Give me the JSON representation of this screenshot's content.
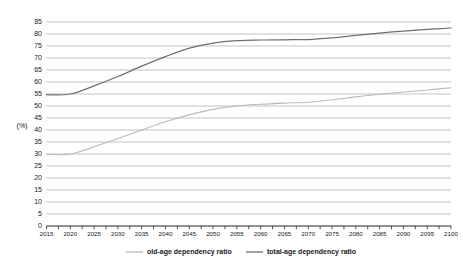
{
  "chart_data": {
    "type": "line",
    "title": "",
    "subtitle": "",
    "xlabel": "",
    "ylabel": "(%)",
    "xlim": [
      2015,
      2100
    ],
    "ylim": [
      0,
      88
    ],
    "grid": true,
    "legend_position": "bottom",
    "ytick_labels": [
      "0",
      "5",
      "10",
      "15",
      "20",
      "25",
      "30",
      "35",
      "40",
      "45",
      "50",
      "55",
      "60",
      "65",
      "70",
      "75",
      "80",
      "85"
    ],
    "ytick_values": [
      0,
      5,
      10,
      15,
      20,
      25,
      30,
      35,
      40,
      45,
      50,
      55,
      60,
      65,
      70,
      75,
      80,
      85
    ],
    "xtick_labels": [
      "2015",
      "2020",
      "2025",
      "2030",
      "2035",
      "2040",
      "2045",
      "2050",
      "2055",
      "2060",
      "2065",
      "2070",
      "2075",
      "2080",
      "2085",
      "2090",
      "2095",
      "2100"
    ],
    "xtick_values": [
      2015,
      2020,
      2025,
      2030,
      2035,
      2040,
      2045,
      2050,
      2055,
      2060,
      2065,
      2070,
      2075,
      2080,
      2085,
      2090,
      2095,
      2100
    ],
    "x": [
      2015,
      2020,
      2025,
      2030,
      2035,
      2040,
      2045,
      2050,
      2055,
      2060,
      2065,
      2070,
      2075,
      2080,
      2085,
      2090,
      2095,
      2100
    ],
    "series": [
      {
        "name": "old-age dependency ratio",
        "color": "#b9b9b9",
        "values": [
          29.8,
          30.0,
          33.0,
          36.5,
          40.0,
          43.4,
          46.3,
          48.6,
          50.0,
          50.7,
          51.2,
          51.6,
          52.6,
          53.8,
          54.9,
          55.8,
          56.7,
          57.6
        ]
      },
      {
        "name": "total-age dependency ratio",
        "color": "#6f6f6f",
        "values": [
          54.7,
          55.0,
          58.4,
          62.3,
          66.6,
          70.6,
          74.1,
          76.2,
          77.2,
          77.5,
          77.6,
          77.7,
          78.4,
          79.4,
          80.4,
          81.2,
          81.9,
          82.5
        ]
      }
    ]
  },
  "legend": {
    "items": [
      {
        "label": "old-age dependency ratio",
        "color": "#b9b9b9"
      },
      {
        "label": "total-age dependency ratio",
        "color": "#6f6f6f"
      }
    ]
  }
}
